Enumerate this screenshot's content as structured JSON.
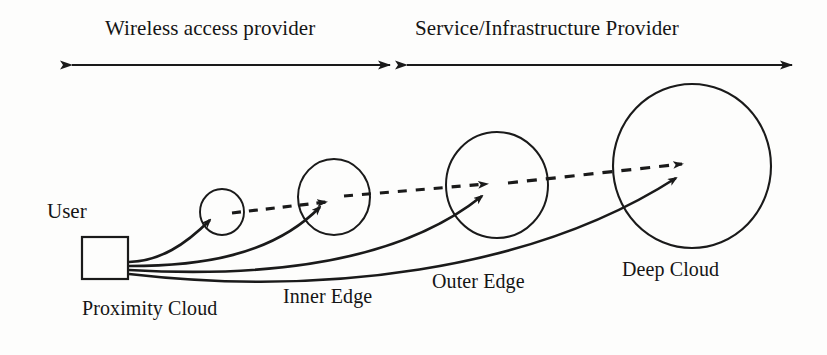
{
  "figure": {
    "background_color": "#fdfdfc",
    "stroke_color": "#1a1a1a"
  },
  "spans": [
    {
      "id": "wireless-access-provider",
      "label": "Wireless access provider",
      "arrow_style": "double-headed",
      "x_start": 72,
      "x_end": 390,
      "y": 65
    },
    {
      "id": "service-infrastructure-provider",
      "label": "Service/Infrastructure Provider",
      "arrow_style": "double-headed",
      "x_start": 407,
      "x_end": 792,
      "y": 65
    }
  ],
  "user": {
    "label": "User",
    "box": {
      "x": 82,
      "y": 237,
      "width": 46,
      "height": 42
    }
  },
  "nodes": [
    {
      "id": "proximity-cloud",
      "label": "Proximity Cloud",
      "shape": "circle",
      "cx": 222,
      "cy": 212,
      "r": 22
    },
    {
      "id": "inner-edge",
      "label": "Inner Edge",
      "shape": "circle",
      "cx": 334,
      "cy": 197,
      "r": 36
    },
    {
      "id": "outer-edge",
      "label": "Outer Edge",
      "shape": "circle",
      "cx": 497,
      "cy": 185,
      "r": 51
    },
    {
      "id": "deep-cloud",
      "label": "Deep Cloud",
      "shape": "circle",
      "cx": 692,
      "cy": 166,
      "r": 79
    }
  ],
  "solid_arrows": [
    {
      "id": "user-to-proximity-cloud",
      "from": "user",
      "to": "proximity-cloud",
      "style": "solid-curved"
    },
    {
      "id": "user-to-inner-edge",
      "from": "user",
      "to": "inner-edge",
      "style": "solid-curved"
    },
    {
      "id": "user-to-outer-edge",
      "from": "user",
      "to": "outer-edge",
      "style": "solid-curved"
    },
    {
      "id": "user-to-deep-cloud",
      "from": "user",
      "to": "deep-cloud",
      "style": "solid-curved"
    }
  ],
  "dashed_arrows": [
    {
      "id": "proximity-to-inner",
      "from": "proximity-cloud",
      "to": "inner-edge",
      "style": "dashed"
    },
    {
      "id": "inner-to-outer",
      "from": "inner-edge",
      "to": "outer-edge",
      "style": "dashed"
    },
    {
      "id": "outer-to-deep",
      "from": "outer-edge",
      "to": "deep-cloud",
      "style": "dashed"
    }
  ]
}
